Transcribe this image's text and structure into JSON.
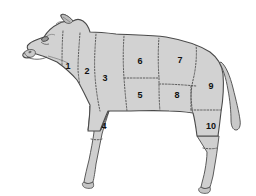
{
  "diagram": {
    "view": "left side profile",
    "background_color": "#ffffff",
    "body_fill_color": "#d2d2d2",
    "leg_fill_color": "#cfcfcf",
    "outline_color": "#4a4a4a",
    "division_line_color": "#5a5a5a",
    "label_color": "#111111",
    "total_cuts": 10,
    "cuts": [
      {
        "id": "cut-1",
        "label": "1",
        "x": 68,
        "y": 67
      },
      {
        "id": "cut-2",
        "label": "2",
        "x": 87,
        "y": 72
      },
      {
        "id": "cut-3",
        "label": "3",
        "x": 105,
        "y": 79
      },
      {
        "id": "cut-4",
        "label": "4",
        "x": 104,
        "y": 127
      },
      {
        "id": "cut-5",
        "label": "5",
        "x": 140,
        "y": 96
      },
      {
        "id": "cut-6",
        "label": "6",
        "x": 140,
        "y": 62
      },
      {
        "id": "cut-7",
        "label": "7",
        "x": 180,
        "y": 61
      },
      {
        "id": "cut-8",
        "label": "8",
        "x": 177,
        "y": 96
      },
      {
        "id": "cut-9",
        "label": "9",
        "x": 211,
        "y": 87
      },
      {
        "id": "cut-10",
        "label": "10",
        "x": 211,
        "y": 127
      }
    ]
  }
}
